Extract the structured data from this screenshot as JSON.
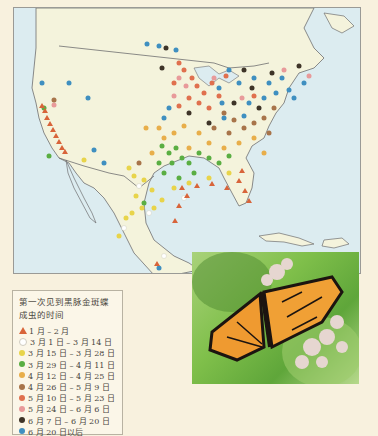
{
  "legend": {
    "title": "第一次见到黑脉金斑蝶成虫的时间",
    "items": [
      {
        "label": "1 月 – 2 月",
        "color": "#d8643a",
        "shape": "triangle"
      },
      {
        "label": "3 月 1 日 – 3 月 14 日",
        "color": "#ffffff",
        "shape": "circle"
      },
      {
        "label": "3 月 15 日 – 3 月 28 日",
        "color": "#e8d44a",
        "shape": "circle"
      },
      {
        "label": "3 月 29 日 – 4 月 11 日",
        "color": "#5aae42",
        "shape": "circle"
      },
      {
        "label": "4 月 12 日 – 4 月 25 日",
        "color": "#e8ae4a",
        "shape": "circle"
      },
      {
        "label": "4 月 26 日 – 5 月 9 日",
        "color": "#a8744a",
        "shape": "circle"
      },
      {
        "label": "5 月 10 日 – 5 月 23 日",
        "color": "#e0704e",
        "shape": "circle"
      },
      {
        "label": "5 月 24 日 – 6 月 6 日",
        "color": "#e89a9a",
        "shape": "circle"
      },
      {
        "label": "6 月 7 日 – 6 月 20 日",
        "color": "#3e3428",
        "shape": "circle"
      },
      {
        "label": "6 月 20 日以后",
        "color": "#3f8fc0",
        "shape": "circle"
      }
    ]
  },
  "map": {
    "region": "North America (USA, Mexico, Caribbean)",
    "land_color": "#f4f3dc",
    "water_color": "#dcecf0"
  },
  "photo": {
    "subject": "monarch butterfly on milkweed flowers"
  }
}
